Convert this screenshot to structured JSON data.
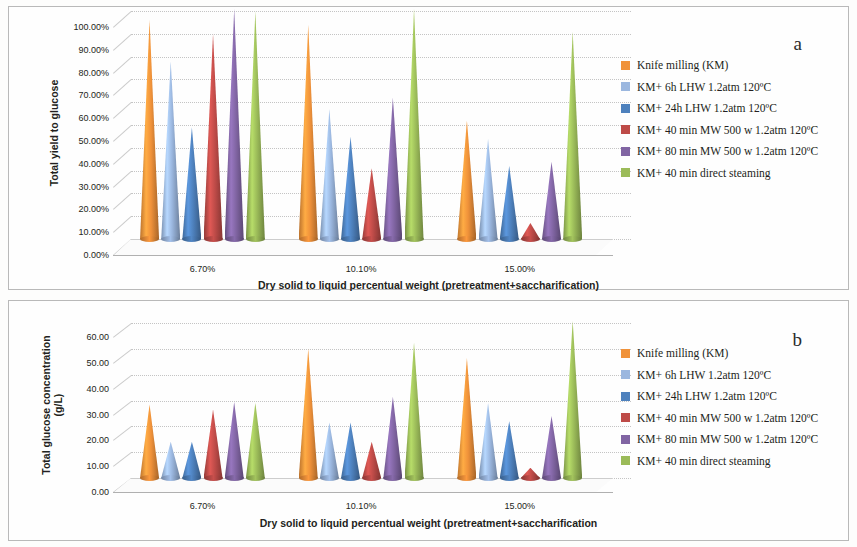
{
  "figure": {
    "panels": [
      {
        "letter": "a",
        "ytitle": "Total yield to glucose",
        "xtitle": "Dry solid to liquid percentual weight (pretreatment+saccharification)",
        "yticks": [
          "0.00%",
          "10.00%",
          "20.00%",
          "30.00%",
          "40.00%",
          "50.00%",
          "60.00%",
          "70.00%",
          "80.00%",
          "90.00%",
          "100.00%"
        ],
        "xticks": [
          "6.70%",
          "10.10%",
          "15.00%"
        ]
      },
      {
        "letter": "b",
        "ytitle": "Total glucose concentration\n(g/L)",
        "xtitle": "Dry solid to liquid percentual weight (pretreatment+saccharification",
        "yticks": [
          "0.00",
          "10.00",
          "20.00",
          "30.00",
          "40.00",
          "50.00",
          "60.00"
        ],
        "xticks": [
          "6.70%",
          "10.10%",
          "15.00%"
        ]
      }
    ],
    "legend": [
      {
        "label": "Knife milling (KM)",
        "color": "#F0923A"
      },
      {
        "label": "KM+ 6h LHW 1.2atm 120ºC",
        "color": "#9BB7DF"
      },
      {
        "label": "KM+ 24h LHW 1.2atm 120ºC",
        "color": "#4E81BD"
      },
      {
        "label": "KM+ 40 min MW 500 w 1.2atm 120ºC",
        "color": "#BE4B48"
      },
      {
        "label": "KM+ 80 min MW 500 w 1.2atm 120ºC",
        "color": "#8165A3"
      },
      {
        "label": "KM+ 40 min direct steaming",
        "color": "#9BBB59"
      }
    ]
  },
  "chart_data": [
    {
      "type": "bar",
      "panel": "a",
      "title": "Total yield to glucose vs dry solid to liquid percentual weight",
      "xlabel": "Dry solid to liquid percentual weight (pretreatment+saccharification)",
      "ylabel": "Total yield to glucose",
      "ylim": [
        0,
        100
      ],
      "ytick_step": 10,
      "yunit": "%",
      "grid": true,
      "legend_position": "right",
      "render": "3d-cone",
      "categories": [
        "6.70%",
        "10.10%",
        "15.00%"
      ],
      "series": [
        {
          "name": "Knife milling (KM)",
          "color": "#F0923A",
          "values": [
            96,
            94,
            52
          ]
        },
        {
          "name": "KM+ 6h LHW 1.2atm 120ºC",
          "color": "#9BB7DF",
          "values": [
            78,
            57,
            44
          ]
        },
        {
          "name": "KM+ 24h LHW 1.2atm 120ºC",
          "color": "#4E81BD",
          "values": [
            49,
            45,
            32
          ]
        },
        {
          "name": "KM+ 40 min MW 500 w 1.2atm 120ºC",
          "color": "#BE4B48",
          "values": [
            90,
            31,
            7
          ]
        },
        {
          "name": "KM+ 80 min MW 500 w 1.2atm 120ºC",
          "color": "#8165A3",
          "values": [
            101,
            62,
            34
          ]
        },
        {
          "name": "KM+ 40 min direct steaming",
          "color": "#9BBB59",
          "values": [
            100,
            101,
            91
          ]
        }
      ]
    },
    {
      "type": "bar",
      "panel": "b",
      "title": "Total glucose concentration vs dry solid to liquid percentual weight",
      "xlabel": "Dry solid to liquid percentual weight (pretreatment+saccharification",
      "ylabel": "Total glucose concentration (g/L)",
      "ylim": [
        0,
        60
      ],
      "ytick_step": 10,
      "yunit": "g/L",
      "grid": true,
      "legend_position": "right",
      "render": "3d-cone",
      "categories": [
        "6.70%",
        "10.10%",
        "15.00%"
      ],
      "series": [
        {
          "name": "Knife milling (KM)",
          "color": "#F0923A",
          "values": [
            28.5,
            50.0,
            46.5
          ]
        },
        {
          "name": "KM+ 6h LHW 1.2atm 120ºC",
          "color": "#9BB7DF",
          "values": [
            14.0,
            21.5,
            29.0
          ]
        },
        {
          "name": "KM+ 24h LHW 1.2atm 120ºC",
          "color": "#4E81BD",
          "values": [
            14.0,
            21.5,
            22.0
          ]
        },
        {
          "name": "KM+ 40 min MW 500 w 1.2atm 120ºC",
          "color": "#BE4B48",
          "values": [
            26.5,
            14.0,
            4.0
          ]
        },
        {
          "name": "KM+ 80 min MW 500 w 1.2atm 120ºC",
          "color": "#8165A3",
          "values": [
            29.5,
            31.5,
            24.0
          ]
        },
        {
          "name": "KM+ 40 min direct steaming",
          "color": "#9BBB59",
          "values": [
            29.0,
            52.5,
            61.0
          ]
        }
      ]
    }
  ]
}
